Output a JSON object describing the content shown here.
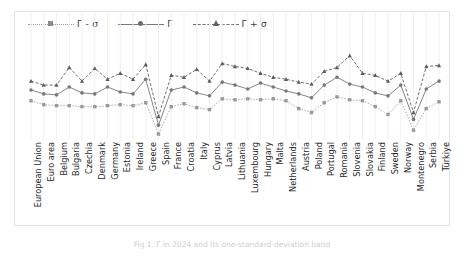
{
  "figure": {
    "caption": "Fig 1. Γ in 2024 and its one-standard-deviation band"
  },
  "legend": {
    "position": "top-left",
    "items": [
      {
        "label": "Γ - σ",
        "marker": "square-marker-icon",
        "style": "dotted"
      },
      {
        "label": "Γ",
        "marker": "circle-marker-icon",
        "style": "solid"
      },
      {
        "label": "Γ + σ",
        "marker": "triangle-marker-icon",
        "style": "dashed"
      }
    ]
  },
  "chart_data": {
    "type": "line",
    "title": "",
    "xlabel": "",
    "ylabel": "",
    "grid": "vertical-only",
    "ylim": [
      0,
      100
    ],
    "categories": [
      "European Union",
      "Euro area",
      "Belgium",
      "Bulgaria",
      "Czechia",
      "Denmark",
      "Germany",
      "Estonia",
      "Ireland",
      "Greece",
      "Spain",
      "France",
      "Croatia",
      "Italy",
      "Cyprus",
      "Latvia",
      "Lithuania",
      "Luxembourg",
      "Hungary",
      "Malta",
      "Netherlands",
      "Austria",
      "Poland",
      "Portugal",
      "Romania",
      "Slovenia",
      "Slovakia",
      "Finland",
      "Sweden",
      "Norway",
      "Montenegro",
      "Serbia",
      "Türkiye"
    ],
    "series": [
      {
        "name": "Γ - σ",
        "marker": "square",
        "linestyle": "dotted",
        "color": "#9a9a9a",
        "values": [
          38,
          34,
          33,
          33,
          32,
          32,
          33,
          34,
          33,
          36,
          4,
          32,
          35,
          31,
          29,
          40,
          39,
          40,
          39,
          40,
          38,
          30,
          26,
          36,
          42,
          39,
          38,
          32,
          24,
          38,
          8,
          30,
          37
        ]
      },
      {
        "name": "Γ",
        "marker": "circle",
        "linestyle": "solid",
        "color": "#787878",
        "values": [
          49,
          45,
          44,
          52,
          46,
          45,
          52,
          47,
          45,
          60,
          13,
          49,
          52,
          46,
          43,
          57,
          54,
          50,
          56,
          52,
          48,
          45,
          41,
          54,
          62,
          55,
          52,
          46,
          43,
          54,
          19,
          50,
          58
        ]
      },
      {
        "name": "Γ + σ",
        "marker": "triangle",
        "linestyle": "dashed",
        "color": "#5d5d5d",
        "values": [
          58,
          54,
          54,
          72,
          58,
          71,
          60,
          66,
          60,
          75,
          22,
          64,
          62,
          70,
          58,
          76,
          73,
          71,
          66,
          62,
          60,
          57,
          55,
          68,
          72,
          84,
          66,
          64,
          58,
          66,
          26,
          73,
          74
        ]
      }
    ]
  }
}
